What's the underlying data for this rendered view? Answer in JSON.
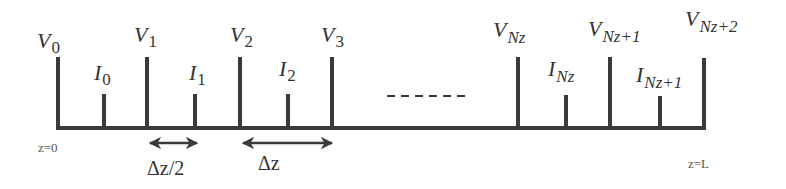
{
  "diagram": {
    "colors": {
      "line": "#3a3a3a",
      "text": "#333333",
      "background": "#ffffff"
    },
    "voltage_nodes": [
      {
        "sym": "V",
        "sub": "0",
        "x": 58
      },
      {
        "sym": "V",
        "sub": "1",
        "x": 147
      },
      {
        "sym": "V",
        "sub": "2",
        "x": 240
      },
      {
        "sym": "V",
        "sub": "3",
        "x": 332
      },
      {
        "sym": "V",
        "sub": "Nz",
        "x": 518
      },
      {
        "sym": "V",
        "sub": "Nz+1",
        "x": 610
      },
      {
        "sym": "V",
        "sub": "Nz+2",
        "x": 703
      }
    ],
    "current_nodes": [
      {
        "sym": "I",
        "sub": "0",
        "x": 104
      },
      {
        "sym": "I",
        "sub": "1",
        "x": 195
      },
      {
        "sym": "I",
        "sub": "2",
        "x": 288
      },
      {
        "sym": "I",
        "sub": "Nz",
        "x": 566
      },
      {
        "sym": "I",
        "sub": "Nz+1",
        "x": 660
      }
    ],
    "ellipsis": "------",
    "boundary_start": "z=0",
    "boundary_end": "z=L",
    "spacing": {
      "half": "Δz/2",
      "full": "Δz"
    }
  }
}
